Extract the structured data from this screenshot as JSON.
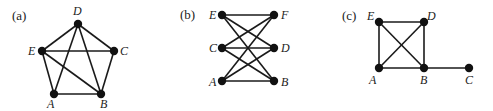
{
  "graphs": [
    {
      "id": "a",
      "panel_label": "(a)",
      "panel_label_pos": [
        12,
        20
      ],
      "vertices": [
        {
          "name": "D",
          "x": 78,
          "y": 24,
          "lx": 73,
          "ly": 15
        },
        {
          "name": "E",
          "x": 42,
          "y": 51,
          "lx": 28,
          "ly": 55
        },
        {
          "name": "C",
          "x": 114,
          "y": 51,
          "lx": 120,
          "ly": 55
        },
        {
          "name": "A",
          "x": 54,
          "y": 94,
          "lx": 47,
          "ly": 108
        },
        {
          "name": "B",
          "x": 101,
          "y": 94,
          "lx": 100,
          "ly": 108
        }
      ],
      "edges": [
        [
          "D",
          "E"
        ],
        [
          "D",
          "C"
        ],
        [
          "D",
          "A"
        ],
        [
          "D",
          "B"
        ],
        [
          "E",
          "C"
        ],
        [
          "E",
          "A"
        ],
        [
          "E",
          "B"
        ],
        [
          "C",
          "B"
        ],
        [
          "A",
          "B"
        ]
      ]
    },
    {
      "id": "b",
      "panel_label": "(b)",
      "panel_label_pos": [
        180,
        19
      ],
      "vertices": [
        {
          "name": "E",
          "x": 222,
          "y": 15,
          "lx": 209,
          "ly": 19
        },
        {
          "name": "F",
          "x": 274,
          "y": 15,
          "lx": 281,
          "ly": 19
        },
        {
          "name": "C",
          "x": 222,
          "y": 48,
          "lx": 209,
          "ly": 52
        },
        {
          "name": "D",
          "x": 274,
          "y": 48,
          "lx": 281,
          "ly": 52
        },
        {
          "name": "A",
          "x": 222,
          "y": 81,
          "lx": 209,
          "ly": 86
        },
        {
          "name": "B",
          "x": 274,
          "y": 81,
          "lx": 281,
          "ly": 86
        }
      ],
      "edges": [
        [
          "E",
          "F"
        ],
        [
          "E",
          "D"
        ],
        [
          "E",
          "B"
        ],
        [
          "C",
          "F"
        ],
        [
          "C",
          "D"
        ],
        [
          "C",
          "B"
        ],
        [
          "A",
          "F"
        ],
        [
          "A",
          "D"
        ],
        [
          "A",
          "B"
        ]
      ]
    },
    {
      "id": "c",
      "panel_label": "(c)",
      "panel_label_pos": [
        342,
        20
      ],
      "vertices": [
        {
          "name": "E",
          "x": 379,
          "y": 22,
          "lx": 367,
          "ly": 20
        },
        {
          "name": "D",
          "x": 424,
          "y": 22,
          "lx": 427,
          "ly": 20
        },
        {
          "name": "A",
          "x": 379,
          "y": 68,
          "lx": 369,
          "ly": 84
        },
        {
          "name": "B",
          "x": 424,
          "y": 68,
          "lx": 420,
          "ly": 84
        },
        {
          "name": "C",
          "x": 469,
          "y": 68,
          "lx": 465,
          "ly": 84
        }
      ],
      "edges": [
        [
          "E",
          "D"
        ],
        [
          "E",
          "A"
        ],
        [
          "E",
          "B"
        ],
        [
          "D",
          "A"
        ],
        [
          "D",
          "B"
        ],
        [
          "A",
          "B"
        ],
        [
          "B",
          "C"
        ]
      ]
    }
  ],
  "style": {
    "edge_color": "#1a1a1a",
    "node_color": "#111111",
    "node_radius": 4.2
  }
}
